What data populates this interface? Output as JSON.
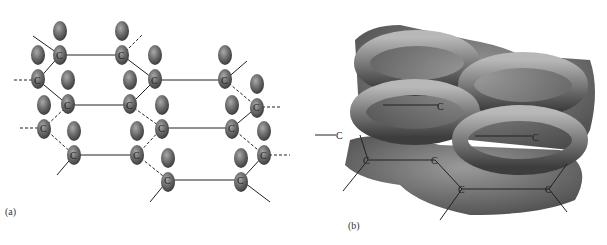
{
  "figure": {
    "panel_a": {
      "label": "(a)",
      "atom_symbol": "C",
      "description": "Two stacked graphite layers of carbon atoms showing p orbitals (lobes) perpendicular to the planes"
    },
    "panel_b": {
      "label": "(b)",
      "atom_symbol": "C",
      "description": "Delocalized pi electron clouds shown as ring-shaped tori above and below the hexagonal carbon layer"
    }
  }
}
